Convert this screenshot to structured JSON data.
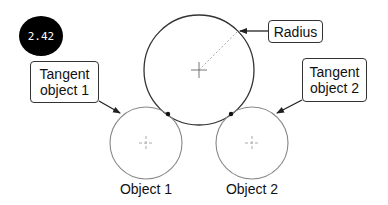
{
  "badge": {
    "value": "2.42"
  },
  "labels": {
    "radius": "Radius",
    "tangent_object_1": "Tangent object 1",
    "tangent_object_2": "Tangent object 2",
    "object_1": "Object 1",
    "object_2": "Object 2"
  },
  "colors": {
    "stroke": "#333333",
    "thin_circle": "#888888",
    "center_mark": "#999999",
    "badge_bg": "#000000",
    "badge_text": "#ffffff"
  },
  "geometry": {
    "big_circle": {
      "cx": 199,
      "cy": 70,
      "r": 55
    },
    "object_1": {
      "cx": 146,
      "cy": 143,
      "r": 36
    },
    "object_2": {
      "cx": 252,
      "cy": 143,
      "r": 36
    },
    "tangent_points": [
      [
        168,
        114
      ],
      [
        231,
        114
      ]
    ]
  }
}
